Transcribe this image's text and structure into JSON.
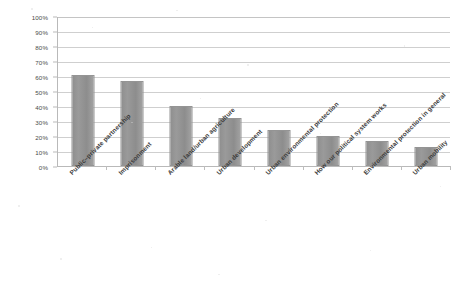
{
  "chart_data": {
    "type": "bar",
    "title": "",
    "xlabel": "",
    "ylabel": "",
    "categories": [
      "Public–private partnership",
      "Imprisonment",
      "Arable land/urban agriculture",
      "Urban development",
      "Urban environmental protection",
      "How our political system works",
      "Environmental protection in general",
      "Urban mobility"
    ],
    "values": [
      61,
      57,
      40,
      32,
      24,
      20,
      17,
      13
    ],
    "value_labels": [
      "61%",
      "57%",
      "40%",
      "32%",
      "24%",
      "20%",
      "17%",
      "13%"
    ],
    "ylim": [
      0,
      100
    ],
    "y_tick_values": [
      0,
      10,
      20,
      30,
      40,
      50,
      60,
      70,
      80,
      90,
      100
    ],
    "y_tick_labels": [
      "0%",
      "10%",
      "20%",
      "30%",
      "40%",
      "50%",
      "60%",
      "70%",
      "80%",
      "90%",
      "100%"
    ],
    "grid": true,
    "grid_axis": "y",
    "legend": false,
    "legend_position": "none",
    "series_name": "",
    "bar_color": "#8f8f8f",
    "grid_color": "#cfcfcf",
    "axis_color": "#b9b9b9",
    "background_color": "#ffffff",
    "label_rotation_degrees": -45
  }
}
